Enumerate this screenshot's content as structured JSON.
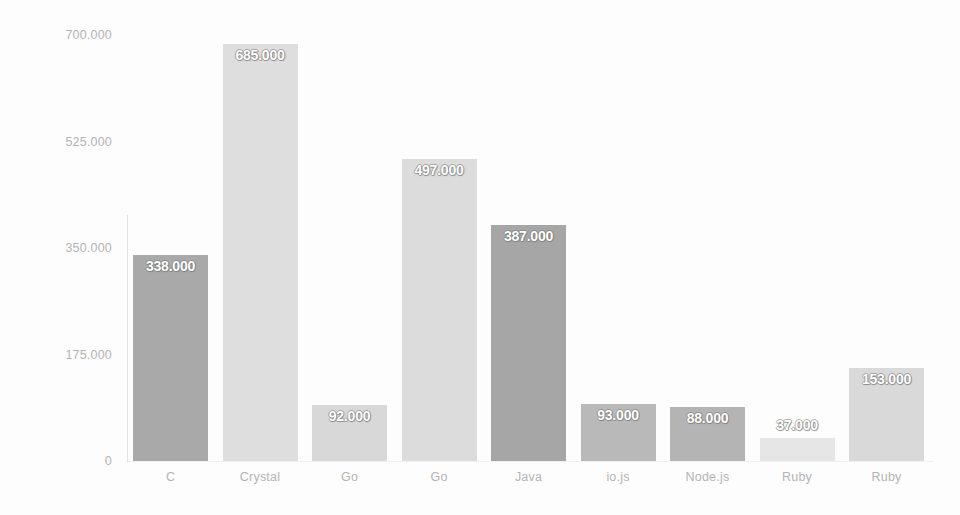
{
  "chart_data": {
    "type": "bar",
    "title": "",
    "subtitle": "",
    "xlabel": "",
    "ylabel": "",
    "categories": [
      "C",
      "Crystal",
      "Go",
      "Go",
      "Java",
      "io.js",
      "Node.js",
      "Ruby",
      "Ruby"
    ],
    "values": [
      338000,
      685000,
      92000,
      497000,
      387000,
      93000,
      88000,
      37000,
      153000
    ],
    "value_labels": [
      "338.000",
      "685.000",
      "92.000",
      "497.000",
      "387.000",
      "93.000",
      "88.000",
      "37.000",
      "153.000"
    ],
    "bar_colors": [
      "#a9a9a9",
      "#dedede",
      "#d8d8d8",
      "#dcdcdc",
      "#a6a6a6",
      "#b9b9b9",
      "#b4b4b4",
      "#e6e6e6",
      "#d9d9d9"
    ],
    "ylim": [
      0,
      700000
    ],
    "yticks": [
      0,
      175000,
      350000,
      525000,
      700000
    ],
    "ytick_labels": [
      "0",
      "175.000",
      "350.000",
      "525.000",
      "700.000"
    ],
    "grid": false,
    "legend": false,
    "legend_position": "none",
    "data_labels_inside": true,
    "axis_label_color": "#b4b4b4",
    "value_label_color": "#ffffff",
    "background_color": "#fdfdfd"
  },
  "bars": [
    {
      "category": "C",
      "value": 338000,
      "label": "338.000",
      "color": "#a9a9a9"
    },
    {
      "category": "Crystal",
      "value": 685000,
      "label": "685.000",
      "color": "#dedede"
    },
    {
      "category": "Go",
      "value": 92000,
      "label": "92.000",
      "color": "#d8d8d8"
    },
    {
      "category": "Go",
      "value": 497000,
      "label": "497.000",
      "color": "#dcdcdc"
    },
    {
      "category": "Java",
      "value": 387000,
      "label": "387.000",
      "color": "#a6a6a6"
    },
    {
      "category": "io.js",
      "value": 93000,
      "label": "93.000",
      "color": "#b9b9b9"
    },
    {
      "category": "Node.js",
      "value": 88000,
      "label": "88.000",
      "color": "#b4b4b4"
    },
    {
      "category": "Ruby",
      "value": 37000,
      "label": "37.000",
      "color": "#e6e6e6"
    },
    {
      "category": "Ruby",
      "value": 153000,
      "label": "153.000",
      "color": "#d9d9d9"
    }
  ]
}
